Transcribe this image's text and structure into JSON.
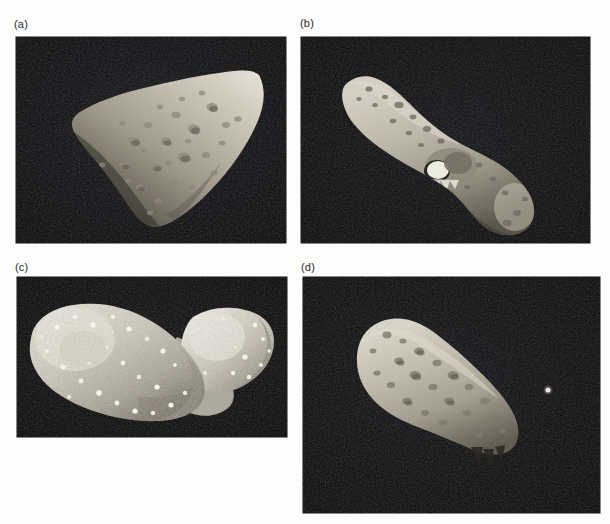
{
  "figure": {
    "background_color": "#fdfdfd",
    "panel_background_color": "#07070a",
    "body_color": "#b9b4a8",
    "label_color": "#2a2a2a",
    "width": 610,
    "height": 524,
    "panels": [
      {
        "id": "a",
        "label": "(a)",
        "subject": "asteroid-gaspra",
        "description": "Irregular wedge-shaped cratered asteroid lit from the upper right, occupying the centre of a black space background.",
        "image_rect": {
          "x": 16,
          "y": 37,
          "w": 270,
          "h": 206
        },
        "label_pos": {
          "x": 14,
          "y": 18
        }
      },
      {
        "id": "b",
        "label": "(b)",
        "subject": "asteroid-eros",
        "description": "Elongated peanut-shaped asteroid oriented diagonally from upper left to lower right with a bright saddle region near the middle.",
        "image_rect": {
          "x": 301,
          "y": 37,
          "w": 289,
          "h": 206
        },
        "label_pos": {
          "x": 300,
          "y": 17
        }
      },
      {
        "id": "c",
        "label": "(c)",
        "subject": "asteroid-itokawa",
        "description": "Bright bilobed rubble-pile asteroid with a boulder strewn surface and a narrow smooth neck between the larger left lobe and smaller right head.",
        "image_rect": {
          "x": 17,
          "y": 277,
          "w": 270,
          "h": 160
        },
        "label_pos": {
          "x": 15,
          "y": 261
        }
      },
      {
        "id": "d",
        "label": "(d)",
        "subject": "asteroid-ida-with-moon-dactyl",
        "description": "Elongated cratered asteroid Ida seen at an angle with its tiny natural satellite Dactyl visible as a small bright dot to the right.",
        "image_rect": {
          "x": 303,
          "y": 277,
          "w": 297,
          "h": 236
        },
        "label_pos": {
          "x": 301,
          "y": 261
        },
        "satellite": {
          "name": "dactyl",
          "x": 245,
          "y": 113,
          "r": 2.6
        }
      }
    ]
  }
}
